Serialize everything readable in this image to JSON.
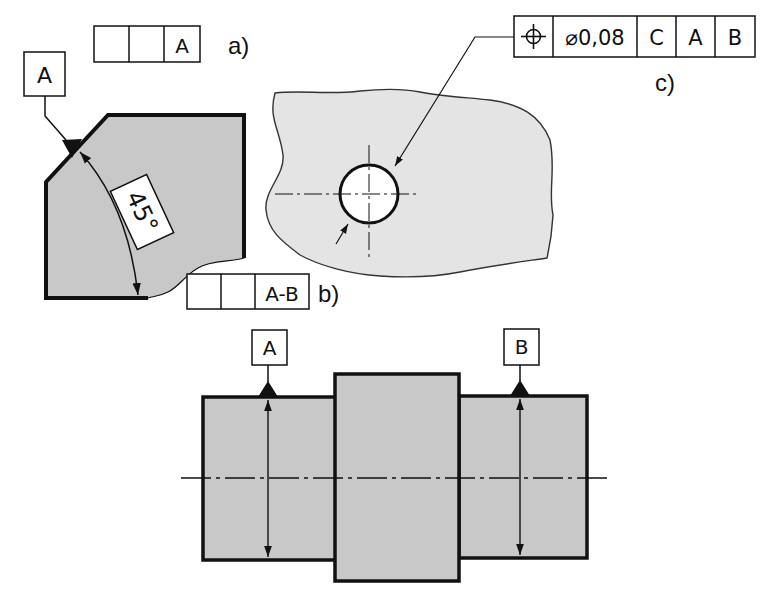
{
  "colors": {
    "part_fill": "#c8c8c8",
    "rough_fill": "#e4e4e4",
    "line": "#111111",
    "background": "#ffffff"
  },
  "figure_a": {
    "label": "a)",
    "frame_cells": [
      "",
      "",
      "A"
    ],
    "datum_label": "A",
    "angle_text": "45°"
  },
  "figure_b": {
    "label": "b)",
    "frame_cells": [
      "",
      "",
      "A-B"
    ]
  },
  "figure_c": {
    "label": "c)",
    "frame": {
      "symbol": "position-icon",
      "tolerance": "⌀0,08",
      "datums": [
        "C",
        "A",
        "B"
      ]
    }
  },
  "shaft": {
    "datum_left": "A",
    "datum_right": "B"
  }
}
